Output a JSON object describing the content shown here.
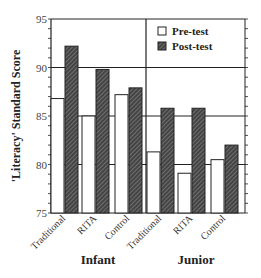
{
  "chart_data": {
    "type": "bar",
    "title": "",
    "ylabel": "'Literacy' Standard Score",
    "xlabel": "",
    "ylim": [
      75,
      95
    ],
    "yticks": [
      75,
      80,
      85,
      90,
      95
    ],
    "grid": true,
    "groups": [
      {
        "label": "Infant",
        "categories": [
          "Traditional",
          "RITA",
          "Control"
        ]
      },
      {
        "label": "Junior",
        "categories": [
          "Traditional",
          "RITA",
          "Control"
        ]
      }
    ],
    "categories": [
      "Infant Traditional",
      "Infant RITA",
      "Infant Control",
      "Junior Traditional",
      "Junior RITA",
      "Junior Control"
    ],
    "series": [
      {
        "name": "Pre-test",
        "fill": "white",
        "values": [
          86.8,
          85.0,
          87.2,
          81.3,
          79.1,
          80.5
        ]
      },
      {
        "name": "Post-test",
        "fill": "hatched",
        "values": [
          92.2,
          89.8,
          87.9,
          85.8,
          85.8,
          82.0
        ]
      }
    ],
    "legend": {
      "position": "top-right",
      "entries": [
        "Pre-test",
        "Post-test"
      ]
    }
  }
}
